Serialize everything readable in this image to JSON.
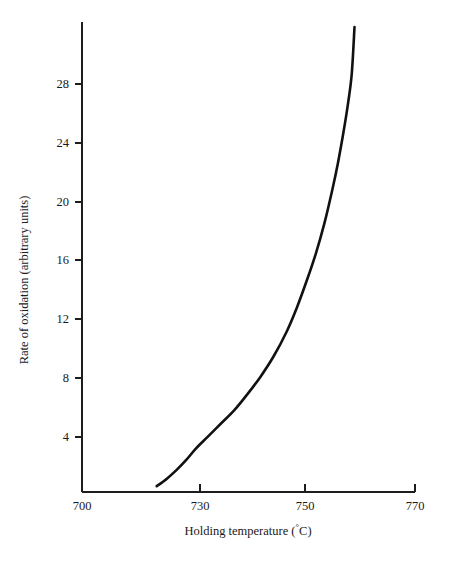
{
  "chart_data": {
    "type": "line",
    "title": "",
    "subtitle": "",
    "xlabel": "Holding temperature (°C)",
    "xlabel_parts": {
      "text_before": "Holding temperature (",
      "degree": "°",
      "text_after": "C)"
    },
    "ylabel": "Rate of oxidation (arbitrary units)",
    "xlim": [
      700,
      770
    ],
    "ylim": [
      0,
      32
    ],
    "grid": false,
    "legend": null,
    "legend_position": "none",
    "xticks": [
      700,
      730,
      750,
      770
    ],
    "xtick_labels": [
      "700",
      "730",
      "750",
      "770"
    ],
    "yticks": [
      4,
      8,
      12,
      16,
      20,
      24,
      28
    ],
    "ytick_labels": [
      "4",
      "8",
      "12",
      "16",
      "20",
      "24",
      "28"
    ],
    "annotations": [],
    "series": [
      {
        "name": "Rate of oxidation",
        "color": "#111111",
        "x": [
          719.0,
          721.5,
          724.0,
          726.5,
          729.0,
          731.5,
          734.0,
          736.5,
          739.0,
          741.5,
          744.0,
          746.5,
          748.5,
          750.5,
          752.0,
          753.5,
          755.0,
          756.0,
          757.0,
          757.8,
          758.5,
          759.0
        ],
        "y": [
          0.4,
          0.9,
          1.5,
          2.2,
          3.0,
          3.8,
          4.7,
          5.6,
          6.7,
          7.9,
          9.3,
          11.0,
          12.7,
          14.7,
          16.4,
          18.4,
          20.8,
          22.6,
          24.7,
          26.6,
          28.7,
          31.9
        ]
      }
    ]
  }
}
